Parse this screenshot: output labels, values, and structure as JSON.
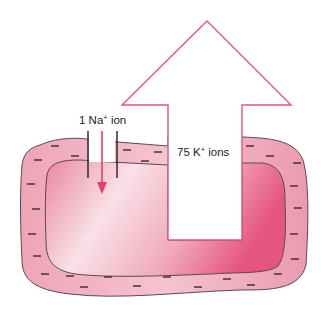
{
  "diagram": {
    "labels": {
      "na_prefix": "1 Na",
      "na_sup": "+",
      "na_suffix": " ion",
      "k_prefix": "75 K",
      "k_sup": "+",
      "k_suffix": " ions"
    },
    "colors": {
      "membrane_fill": "#f2b7c6",
      "membrane_stroke": "#5a4a4e",
      "cytoplasm_light": "#f9dbe3",
      "cytoplasm_dark": "#e8668c",
      "arrow_outline": "#e0577f",
      "na_arrow": "#e63b6f",
      "charge_mark": "#3a2a2e"
    },
    "charge_marks": "-",
    "elements": [
      "cell-membrane (outer layer with negative charges)",
      "cytoplasm (inner gradient region)",
      "sodium-channel with downward Na+ influx arrow",
      "large outward potassium efflux arrow"
    ]
  }
}
